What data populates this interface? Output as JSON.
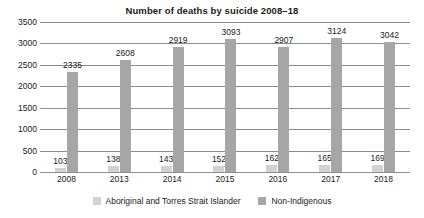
{
  "chart_data": {
    "type": "bar",
    "title": "Number of deaths by suicide 2008–18",
    "xlabel": "",
    "ylabel": "",
    "ylim": [
      0,
      3500
    ],
    "ytick_labels": [
      "3500",
      "3000",
      "2500",
      "2000",
      "1500",
      "1000",
      "500",
      "0"
    ],
    "ytick_values": [
      3500,
      3000,
      2500,
      2000,
      1500,
      1000,
      500,
      0
    ],
    "grid": true,
    "legend_position": "bottom",
    "categories": [
      "2008",
      "2013",
      "2014",
      "2015",
      "2016",
      "2017",
      "2018"
    ],
    "series": [
      {
        "name": "Aboriginal and Torres Strait Islander",
        "color": "#d2d2d2",
        "values": [
          103,
          138,
          143,
          152,
          162,
          165,
          169
        ],
        "labels": [
          "103",
          "138",
          "143",
          "152",
          "162",
          "165",
          "169"
        ]
      },
      {
        "name": "Non-Indigenous",
        "color": "#a6a6a6",
        "values": [
          2335,
          2608,
          2919,
          3093,
          2907,
          3124,
          3042
        ],
        "labels": [
          "2335",
          "2608",
          "2919",
          "3093",
          "2907",
          "3124",
          "3042"
        ]
      }
    ]
  },
  "colors": {
    "background": "#ffffff",
    "gridline": "#8c8c8c",
    "text": "#1a1a1a",
    "series_indigenous": "#d2d2d2",
    "series_nonindigenous": "#a6a6a6"
  }
}
